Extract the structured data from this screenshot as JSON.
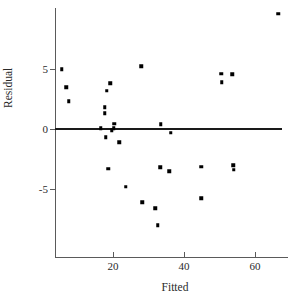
{
  "chart_data": {
    "type": "scatter",
    "title": "",
    "xlabel": "Fitted",
    "ylabel": "Residual",
    "xlim": [
      3,
      69
    ],
    "ylim": [
      -9.2,
      9.8
    ],
    "xticks": [
      20,
      40,
      60
    ],
    "xtick_labels": [
      "20",
      "40",
      "60"
    ],
    "yticks": [
      5,
      0,
      -5
    ],
    "ytick_labels": [
      "5",
      "0",
      "-5"
    ],
    "grid": false,
    "legend": null,
    "reference_line": {
      "type": "horizontal",
      "y": 0,
      "label": "zero residual line",
      "color": "#1a1a1a"
    },
    "marker": {
      "shape": "square",
      "color": "#000000",
      "size": 3.5
    },
    "points": [
      {
        "x": 5.6,
        "y": 5.0
      },
      {
        "x": 6.8,
        "y": 3.5
      },
      {
        "x": 7.6,
        "y": 2.3
      },
      {
        "x": 16.6,
        "y": 0.05
      },
      {
        "x": 17.7,
        "y": 1.8
      },
      {
        "x": 17.7,
        "y": 1.3
      },
      {
        "x": 18.0,
        "y": -0.7
      },
      {
        "x": 18.3,
        "y": 3.2
      },
      {
        "x": 18.6,
        "y": -3.3
      },
      {
        "x": 19.2,
        "y": 3.8
      },
      {
        "x": 19.7,
        "y": -0.1
      },
      {
        "x": 20.2,
        "y": 0.05
      },
      {
        "x": 20.4,
        "y": 0.45
      },
      {
        "x": 21.7,
        "y": -1.1
      },
      {
        "x": 23.6,
        "y": -4.8
      },
      {
        "x": 27.9,
        "y": 5.25
      },
      {
        "x": 28.2,
        "y": -6.1
      },
      {
        "x": 31.9,
        "y": -6.6
      },
      {
        "x": 32.6,
        "y": -8.0
      },
      {
        "x": 33.3,
        "y": -3.2
      },
      {
        "x": 33.5,
        "y": 0.4
      },
      {
        "x": 35.8,
        "y": -3.5
      },
      {
        "x": 36.3,
        "y": -0.3
      },
      {
        "x": 44.9,
        "y": -3.15
      },
      {
        "x": 44.9,
        "y": -5.75
      },
      {
        "x": 50.5,
        "y": 4.6
      },
      {
        "x": 50.7,
        "y": 3.9
      },
      {
        "x": 53.6,
        "y": 4.55
      },
      {
        "x": 53.9,
        "y": -3.0
      },
      {
        "x": 54.0,
        "y": -3.4
      },
      {
        "x": 66.5,
        "y": 9.6
      }
    ]
  },
  "axes": {
    "x": {
      "pixels_per_unit": 3.55,
      "origin_px": 42,
      "label": "Fitted"
    },
    "y": {
      "pixels_per_unit": 12.0,
      "zero_px": 129,
      "label": "Residual"
    }
  }
}
